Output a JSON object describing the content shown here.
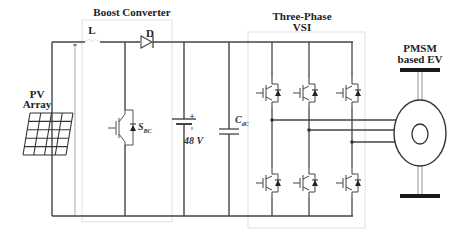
{
  "labels": {
    "pv_array_line1": "PV",
    "pv_array_line2": "Array",
    "boost_converter": "Boost Converter",
    "inductor": "L",
    "diode": "D",
    "switch_main": "S",
    "switch_sub": "BC",
    "battery_plus": "+",
    "battery_voltage": "48 V",
    "capacitor_main": "C",
    "capacitor_sub": "dC",
    "vsi_line1": "Three-Phase",
    "vsi_line2": "VSI",
    "motor_line1": "PMSM",
    "motor_line2": "based EV"
  },
  "components": [
    {
      "id": "pv-array",
      "type": "solar-panel",
      "label": "PV Array"
    },
    {
      "id": "inductor",
      "type": "inductor",
      "label": "L"
    },
    {
      "id": "diode",
      "type": "diode",
      "label": "D"
    },
    {
      "id": "boost-switch",
      "type": "igbt-with-antiparallel-diode",
      "label": "S_BC"
    },
    {
      "id": "battery",
      "type": "battery",
      "label": "48 V"
    },
    {
      "id": "dc-link-capacitor",
      "type": "capacitor",
      "label": "C_dC"
    },
    {
      "id": "vsi",
      "type": "three-phase-inverter",
      "label": "Three-Phase VSI",
      "legs": 3,
      "switches": 6
    },
    {
      "id": "motor",
      "type": "pmsm",
      "label": "PMSM based EV"
    }
  ],
  "colors": {
    "wire": "#444444",
    "box": "#e6e6e6",
    "text": "#222222",
    "shaft_bar": "#1a1a1a"
  }
}
